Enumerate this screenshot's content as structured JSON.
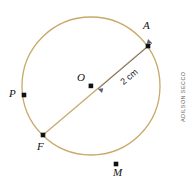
{
  "figure": {
    "background_color": "#ffffff",
    "circle_stroke_color": "#c8a96a",
    "point_color": "#111111",
    "line_color": "#c8a96a",
    "arrow_color": "#4a4a6a"
  },
  "labels": {
    "center": "O",
    "point_a": "A",
    "point_p": "P",
    "point_f": "F",
    "point_m": "M",
    "radius_measure": "2 cm"
  },
  "credit": {
    "text": "ADILSON SECCO"
  },
  "geometry": {
    "circle_center_x": 91,
    "circle_center_y": 86,
    "circle_radius": 69,
    "point_a_x": 148,
    "point_a_y": 46,
    "point_f_x": 43,
    "point_f_y": 135,
    "point_p_x": 24,
    "point_p_y": 95,
    "point_m_x": 116,
    "point_m_y": 164,
    "radius_length_cm": 2
  }
}
